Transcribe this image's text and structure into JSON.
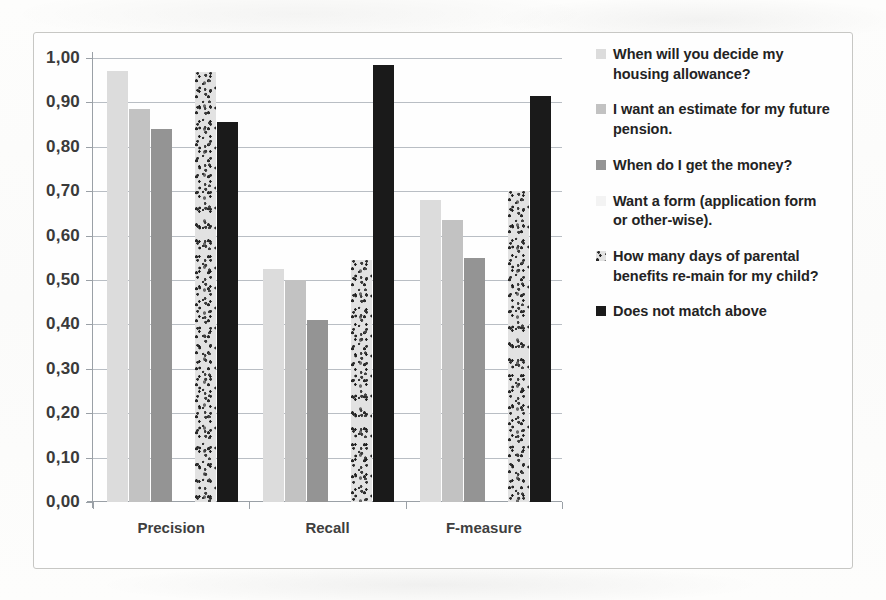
{
  "chart_data": {
    "type": "bar",
    "title": "",
    "xlabel": "",
    "ylabel": "",
    "grid": true,
    "legend_position": "right",
    "ylim": [
      0.0,
      1.0
    ],
    "categories": [
      "Precision",
      "Recall",
      "F-measure"
    ],
    "ytick_labels": [
      "1,00",
      "0,90",
      "0,80",
      "0,70",
      "0,60",
      "0,50",
      "0,40",
      "0,30",
      "0,20",
      "0,10",
      "0,00"
    ],
    "ytick_values": [
      1.0,
      0.9,
      0.8,
      0.7,
      0.6,
      0.5,
      0.4,
      0.3,
      0.2,
      0.1,
      0.0
    ],
    "series": [
      {
        "name": "When will you decide my housing allowance?",
        "color": "#dcdcdc",
        "pattern": "solid",
        "values": [
          0.97,
          0.525,
          0.68
        ]
      },
      {
        "name": "I want an estimate for my future pension.",
        "color": "#c2c2c2",
        "pattern": "solid",
        "values": [
          0.885,
          0.5,
          0.635
        ]
      },
      {
        "name": "When do I get the money?",
        "color": "#949494",
        "pattern": "solid",
        "values": [
          0.84,
          0.41,
          0.55
        ]
      },
      {
        "name": "Want a form (application form or other-wise).",
        "color": "#f3f3f3",
        "pattern": "solid",
        "values": [
          0.0,
          0.0,
          0.0
        ]
      },
      {
        "name": "How many days of parental benefits re-main for my child?",
        "color": "#e2e2e2",
        "pattern": "speckled",
        "values": [
          0.968,
          0.545,
          0.7
        ]
      },
      {
        "name": "Does not match above",
        "color": "#1a1a1a",
        "pattern": "solid",
        "values": [
          0.855,
          0.985,
          0.915
        ]
      }
    ]
  }
}
